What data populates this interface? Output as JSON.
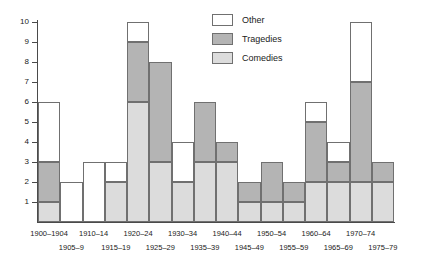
{
  "chart_data": {
    "type": "bar",
    "subtype": "stacked-bar",
    "title": "",
    "subtitle": "",
    "xlabel": "",
    "ylabel": "",
    "ylim": [
      0,
      10
    ],
    "yticks": [
      1,
      2,
      3,
      4,
      5,
      6,
      7,
      8,
      9,
      10
    ],
    "grid": false,
    "legend_position": "top-center",
    "categories": [
      "1900–1904",
      "1905–9",
      "1910–14",
      "1915–19",
      "1920–24",
      "1925–29",
      "1930–34",
      "1935–39",
      "1940–44",
      "1945–49",
      "1950–54",
      "1955–59",
      "1960–64",
      "1965–69",
      "1970–74",
      "1975–79"
    ],
    "series": [
      {
        "name": "Comedies",
        "color": "#dcdcdc",
        "values": [
          1,
          0,
          0,
          2,
          6,
          3,
          2,
          3,
          3,
          1,
          1,
          1,
          2,
          2,
          2,
          2
        ]
      },
      {
        "name": "Tragedies",
        "color": "#b4b4b4",
        "values": [
          2,
          0,
          0,
          0,
          3,
          5,
          0,
          3,
          1,
          1,
          2,
          1,
          3,
          1,
          5,
          1
        ]
      },
      {
        "name": "Other",
        "color": "#ffffff",
        "values": [
          3,
          2,
          3,
          1,
          1,
          0,
          2,
          0,
          0,
          0,
          0,
          0,
          1,
          1,
          3,
          0
        ]
      }
    ],
    "totals": [
      6,
      2,
      3,
      3,
      10,
      8,
      4,
      6,
      4,
      2,
      3,
      2,
      6,
      4,
      10,
      3
    ]
  },
  "legend": {
    "items": [
      {
        "label": "Other",
        "swatch": "other"
      },
      {
        "label": "Tragedies",
        "swatch": "tragedies"
      },
      {
        "label": "Comedies",
        "swatch": "comedies"
      }
    ]
  },
  "axis": {
    "y_tick_labels": [
      "1",
      "2",
      "3",
      "4",
      "5",
      "6",
      "7",
      "8",
      "9",
      "10"
    ]
  },
  "colors": {
    "other": "#ffffff",
    "tragedies": "#b4b4b4",
    "comedies": "#dcdcdc",
    "outline": "#707070",
    "axis": "#4a4a4a",
    "text": "#1a1a1a",
    "background": "#ffffff"
  }
}
